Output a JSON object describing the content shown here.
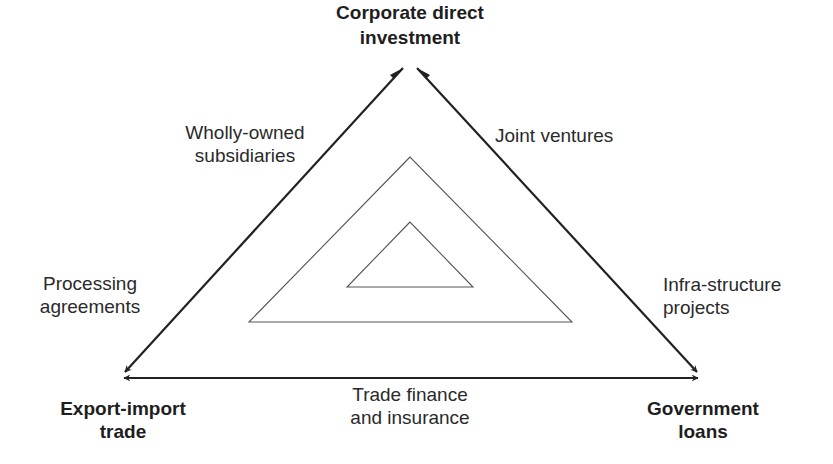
{
  "diagram": {
    "colors": {
      "background": "#ffffff",
      "outer_line": "#222222",
      "inner_line": "#555555",
      "text": "#222222"
    },
    "vertices": {
      "top": {
        "line1": "Corporate direct",
        "line2": "investment"
      },
      "bottom_left": {
        "line1": "Export-import",
        "line2": "trade"
      },
      "bottom_right": {
        "line1": "Government",
        "line2": "loans"
      }
    },
    "edge_labels": {
      "top_left_upper": {
        "line1": "Wholly-owned",
        "line2": "subsidiaries"
      },
      "top_left_lower": {
        "line1": "Processing",
        "line2": "agreements"
      },
      "top_right_upper": {
        "line1": "Joint ventures"
      },
      "top_right_lower": {
        "line1": "Infra-structure",
        "line2": "projects"
      },
      "bottom": {
        "line1": "Trade finance",
        "line2": "and insurance"
      }
    },
    "geometry": {
      "outer_triangle": {
        "top": [
          410,
          62
        ],
        "bottom_left": [
          120,
          377
        ],
        "bottom_right": [
          700,
          377
        ]
      },
      "middle_triangle": {
        "top": [
          410,
          157
        ],
        "bottom_left": [
          249,
          322
        ],
        "bottom_right": [
          572,
          322
        ]
      },
      "inner_triangle": {
        "top": [
          410,
          222
        ],
        "bottom_left": [
          347,
          287
        ],
        "bottom_right": [
          473,
          287
        ]
      }
    }
  }
}
